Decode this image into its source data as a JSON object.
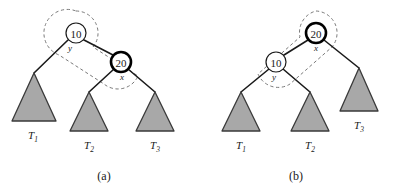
{
  "figure": {
    "background_color": "#ffffff",
    "panels": [
      {
        "id": "panel-a",
        "caption": "(a)",
        "caption_x": 104,
        "caption_y": 180,
        "nodes": [
          {
            "id": "node-a-10",
            "value": "10",
            "tag": "y",
            "cx": 76,
            "cy": 33,
            "r": 10,
            "stroke_width": 1.2,
            "fill": "#ffffff",
            "stroke": "#1a1a1a",
            "tag_x": 70,
            "tag_y": 51
          },
          {
            "id": "node-a-20",
            "value": "20",
            "tag": "x",
            "cx": 121,
            "cy": 62,
            "r": 10,
            "stroke_width": 2.6,
            "fill": "#ffffff",
            "stroke": "#000000",
            "tag_x": 122,
            "tag_y": 80
          }
        ],
        "edges": [
          {
            "id": "edge-a-10-to-T1",
            "x1": 68,
            "x2": 34,
            "y1": 40,
            "y2": 73
          },
          {
            "id": "edge-a-10-to-20",
            "x1": 84,
            "x2": 113,
            "y1": 40,
            "y2": 55
          },
          {
            "id": "edge-a-20-to-T2",
            "x1": 114,
            "x2": 89,
            "y1": 69,
            "y2": 92
          },
          {
            "id": "edge-a-20-to-T3",
            "x1": 128,
            "x2": 155,
            "y1": 69,
            "y2": 92
          }
        ],
        "subtrees": [
          {
            "id": "subtree-a-T1",
            "label": "T",
            "sub": "1",
            "apex_x": 34,
            "apex_y": 73,
            "half_width": 22,
            "base_y": 121,
            "label_x": 33,
            "label_y": 139
          },
          {
            "id": "subtree-a-T2",
            "label": "T",
            "sub": "2",
            "apex_x": 89,
            "apex_y": 92,
            "half_width": 19,
            "base_y": 131,
            "label_x": 89,
            "label_y": 149
          },
          {
            "id": "subtree-a-T3",
            "label": "T",
            "sub": "3",
            "apex_x": 155,
            "apex_y": 92,
            "half_width": 19,
            "base_y": 131,
            "label_x": 155,
            "label_y": 149
          }
        ],
        "enclosure": {
          "id": "enclosure-a",
          "path": "M 76 11 A 22 22 0 0 1 93 47 L 138 76 A 22 22 0 0 1 104 84 L 59 55 A 22 22 0 0 1 76 11 Z",
          "stroke": "#7a7a7a",
          "dash": "3.2,2.6",
          "stroke_width": 1.0
        }
      },
      {
        "id": "panel-b",
        "caption": "(b)",
        "caption_x": 296,
        "caption_y": 180,
        "nodes": [
          {
            "id": "node-b-20",
            "value": "20",
            "tag": "x",
            "cx": 316,
            "cy": 33,
            "r": 10,
            "stroke_width": 2.6,
            "fill": "#ffffff",
            "stroke": "#000000",
            "tag_x": 316,
            "tag_y": 51
          },
          {
            "id": "node-b-10",
            "value": "10",
            "tag": "y",
            "cx": 276,
            "cy": 62,
            "r": 10,
            "stroke_width": 1.2,
            "fill": "#ffffff",
            "stroke": "#1a1a1a",
            "tag_x": 274,
            "tag_y": 80
          }
        ],
        "edges": [
          {
            "id": "edge-b-20-to-10",
            "x1": 308,
            "x2": 284,
            "y1": 40,
            "y2": 55
          },
          {
            "id": "edge-b-20-to-T3",
            "x1": 324,
            "x2": 359,
            "y1": 40,
            "y2": 68
          },
          {
            "id": "edge-b-10-to-T1",
            "x1": 269,
            "x2": 241,
            "y1": 69,
            "y2": 92
          },
          {
            "id": "edge-b-10-to-T2",
            "x1": 283,
            "x2": 310,
            "y1": 69,
            "y2": 92
          }
        ],
        "subtrees": [
          {
            "id": "subtree-b-T1",
            "label": "T",
            "sub": "1",
            "apex_x": 241,
            "apex_y": 92,
            "half_width": 19,
            "base_y": 131,
            "label_x": 241,
            "label_y": 149
          },
          {
            "id": "subtree-b-T2",
            "label": "T",
            "sub": "2",
            "apex_x": 310,
            "apex_y": 92,
            "half_width": 19,
            "base_y": 131,
            "label_x": 310,
            "label_y": 149
          },
          {
            "id": "subtree-b-T3",
            "label": "T",
            "sub": "3",
            "apex_x": 359,
            "apex_y": 68,
            "half_width": 19,
            "base_y": 111,
            "label_x": 359,
            "label_y": 129
          }
        ],
        "enclosure": {
          "id": "enclosure-b",
          "path": "M 316 11 A 22 22 0 0 1 332 47 L 290 84 A 22 22 0 0 1 258 74 L 300 37 A 22 22 0 0 1 316 11 Z",
          "stroke": "#7a7a7a",
          "dash": "3.2,2.6",
          "stroke_width": 1.0
        }
      }
    ],
    "style": {
      "subtree_fill": "#a8a8a8",
      "subtree_stroke": "#3a3a3a",
      "edge_color": "#1a1a1a",
      "edge_width": 1.6,
      "text_color": "#1a1a1a"
    }
  }
}
